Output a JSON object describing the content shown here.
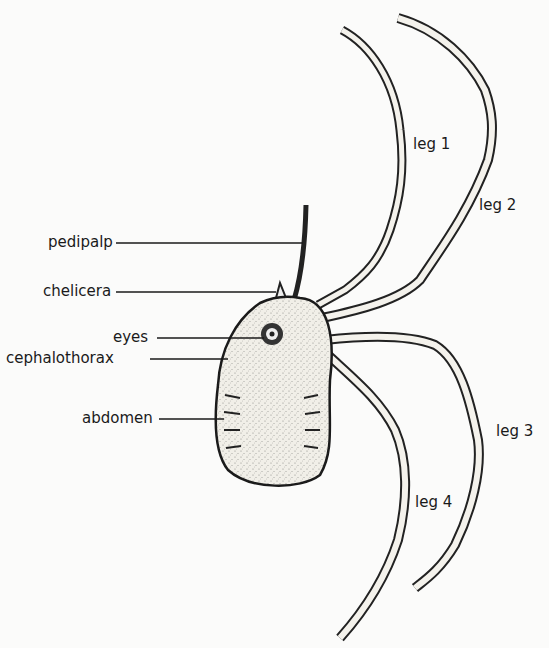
{
  "figure": {
    "labels": {
      "pedipalp": "pedipalp",
      "chelicera": "chelicera",
      "eyes": "eyes",
      "cephalothorax": "cephalothorax",
      "abdomen": "abdomen",
      "leg1": "leg 1",
      "leg2": "leg 2",
      "leg3": "leg 3",
      "leg4": "leg 4"
    }
  }
}
